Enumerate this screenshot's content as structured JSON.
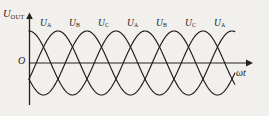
{
  "figure": {
    "title_alt": "Three-phase output voltage waveform",
    "background_color": "#f2f0ec",
    "ink_color": "#1d1b1a"
  },
  "axes": {
    "y_label": {
      "symbol": "U",
      "subscript": "OUT"
    },
    "x_label": "ωt",
    "origin_label": "O",
    "x_axis": {
      "start_px": 29,
      "end_px": 250,
      "y_px": 63,
      "arrow": true
    },
    "y_axis": {
      "x_px": 29,
      "top_px": 14,
      "bottom_px": 105,
      "arrow": true
    }
  },
  "wave_labels": [
    {
      "symbol": "U",
      "subscript": "A",
      "x": 40,
      "y": 19
    },
    {
      "symbol": "U",
      "subscript": "B",
      "x": 69,
      "y": 19
    },
    {
      "symbol": "U",
      "subscript": "C",
      "x": 98,
      "y": 19
    },
    {
      "symbol": "U",
      "subscript": "A",
      "x": 127,
      "y": 19
    },
    {
      "symbol": "U",
      "subscript": "B",
      "x": 156,
      "y": 19
    },
    {
      "symbol": "U",
      "subscript": "C",
      "x": 185,
      "y": 19
    },
    {
      "symbol": "U",
      "subscript": "A",
      "x": 214,
      "y": 19
    }
  ],
  "chart_data": {
    "type": "line",
    "title": "",
    "xlabel": "ωt",
    "ylabel": "U_OUT",
    "grid": false,
    "legend": "inline-peak-labels",
    "x_range_px": [
      29,
      235
    ],
    "baseline_px": 63,
    "amplitude_px": 32,
    "period_px": 87,
    "peak_px": 32,
    "trough_px": 97,
    "phase_labels": [
      "U_A",
      "U_B",
      "U_C",
      "U_A",
      "U_B",
      "U_C",
      "U_A"
    ],
    "series": [
      {
        "name": "U_A",
        "phase_deg": 0,
        "amplitude": 1,
        "color": "#1d1b1a"
      },
      {
        "name": "U_B",
        "phase_deg": -120,
        "amplitude": 1,
        "color": "#1d1b1a"
      },
      {
        "name": "U_C",
        "phase_deg": -240,
        "amplitude": 1,
        "color": "#1d1b1a"
      }
    ],
    "peak_positions_px": [
      46,
      75,
      104,
      133,
      162,
      191,
      220
    ]
  }
}
